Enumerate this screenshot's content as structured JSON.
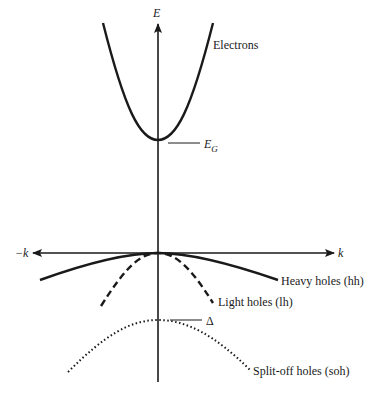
{
  "diagram": {
    "axes": {
      "vertical_label": "E",
      "horizontal_right_label": "k",
      "horizontal_left_label": "−k"
    },
    "bands": [
      {
        "name": "electrons",
        "label": "Electrons",
        "style": "solid"
      },
      {
        "name": "heavy-holes",
        "label": "Heavy holes (hh)",
        "style": "solid"
      },
      {
        "name": "light-holes",
        "label": "Light holes (lh)",
        "style": "dashed"
      },
      {
        "name": "split-off-holes",
        "label": "Split-off holes (soh)",
        "style": "dotted"
      }
    ],
    "annotations": {
      "band_gap_symbol": "E",
      "band_gap_subscript": "G",
      "split_off_energy": "Δ"
    },
    "colors": {
      "ink": "#1a1a1a",
      "background": "#ffffff"
    }
  }
}
